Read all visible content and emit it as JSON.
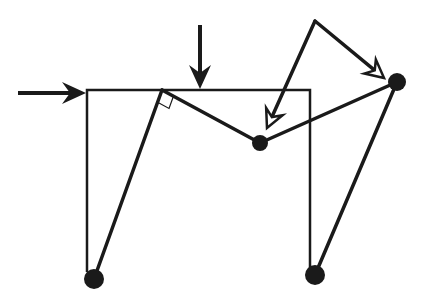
{
  "diagram": {
    "type": "force-vector / linkage diagram",
    "colors": {
      "background": "#ffffff",
      "stroke": "#1a1a1a",
      "open_arrow_fill": "#ffffff"
    },
    "frame": {
      "top_left": [
        87,
        90
      ],
      "top_right": [
        310,
        90
      ],
      "bottom_left": [
        87,
        272
      ],
      "bottom_right": [
        310,
        276
      ]
    },
    "nodes": [
      {
        "id": "A",
        "label": "right-angle-vertex",
        "x": 162,
        "y": 90,
        "filled": false
      },
      {
        "id": "B",
        "label": "ball-middle",
        "x": 260,
        "y": 143,
        "filled": true,
        "r": 8
      },
      {
        "id": "C",
        "label": "ball-right",
        "x": 397,
        "y": 82,
        "filled": true,
        "r": 9
      },
      {
        "id": "D",
        "label": "ball-bottom-left",
        "x": 94,
        "y": 279,
        "filled": true,
        "r": 10
      },
      {
        "id": "E",
        "label": "ball-bottom-right",
        "x": 315,
        "y": 275,
        "filled": true,
        "r": 10
      },
      {
        "id": "F",
        "label": "apex",
        "x": 315,
        "y": 21,
        "filled": false
      }
    ],
    "links": [
      {
        "from": "D",
        "to": "A"
      },
      {
        "from": "A",
        "to": "B"
      },
      {
        "from": "B",
        "to": "C"
      },
      {
        "from": "C",
        "to": "E"
      }
    ],
    "arrows": [
      {
        "name": "horizontal-input-arrow",
        "from": [
          18,
          93
        ],
        "to": [
          86,
          93
        ],
        "style": "filled"
      },
      {
        "name": "downward-force-arrow",
        "from": [
          200,
          25
        ],
        "to": [
          200,
          89
        ],
        "style": "filled"
      },
      {
        "name": "apex-to-ball-middle-arrow",
        "from": [
          315,
          21
        ],
        "to": [
          267,
          128
        ],
        "style": "open"
      },
      {
        "name": "apex-to-ball-right-arrow",
        "from": [
          315,
          21
        ],
        "to": [
          384,
          78
        ],
        "style": "open"
      }
    ],
    "right_angle_marker": {
      "at": "A"
    }
  }
}
